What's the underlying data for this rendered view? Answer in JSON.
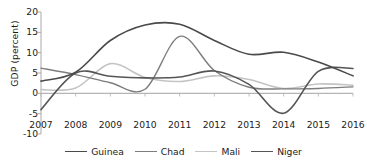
{
  "chart_data": {
    "type": "line",
    "title": "",
    "xlabel": "",
    "ylabel": "GDP (percent)",
    "xlim": [
      2007,
      2016
    ],
    "ylim": [
      -10,
      20
    ],
    "ytick_labels": [
      "20",
      "15",
      "10",
      "5",
      "0",
      "-5",
      "-10"
    ],
    "ytick_values": [
      20,
      15,
      10,
      5,
      0,
      -5,
      -10
    ],
    "xtick_labels": [
      "2007",
      "2008",
      "2009",
      "2010",
      "2011",
      "2012",
      "2013",
      "2014",
      "2015",
      "2016"
    ],
    "x": [
      2007,
      2008,
      2009,
      2010,
      2011,
      2012,
      2013,
      2014,
      2015,
      2016
    ],
    "grid": false,
    "legend_position": "bottom",
    "series": [
      {
        "name": "Guinea",
        "color": "#4a4a4a",
        "width": 1.6,
        "values": [
          3.0,
          5.2,
          13.0,
          16.8,
          17.0,
          13.0,
          9.6,
          10.1,
          7.7,
          4.3
        ]
      },
      {
        "name": "Chad",
        "color": "#7d7d7d",
        "width": 1.4,
        "values": [
          6.2,
          4.6,
          2.6,
          1.0,
          14.0,
          5.6,
          1.5,
          1.1,
          1.2,
          1.6
        ]
      },
      {
        "name": "Mali",
        "color": "#c4c4c4",
        "width": 1.6,
        "values": [
          0.9,
          1.3,
          7.3,
          3.9,
          2.9,
          4.3,
          3.4,
          1.2,
          2.3,
          2.0
        ]
      },
      {
        "name": "Niger",
        "color": "#555555",
        "width": 1.6,
        "values": [
          -4.0,
          5.0,
          4.2,
          3.8,
          4.0,
          5.5,
          2.2,
          -4.9,
          5.4,
          6.1
        ]
      }
    ]
  },
  "legend": {
    "items": [
      {
        "label": "Guinea"
      },
      {
        "label": "Chad"
      },
      {
        "label": "Mali"
      },
      {
        "label": "Niger"
      }
    ]
  },
  "axis": {
    "baseline_color": "#b5b5b5",
    "axis_color": "#a0a0a0"
  }
}
